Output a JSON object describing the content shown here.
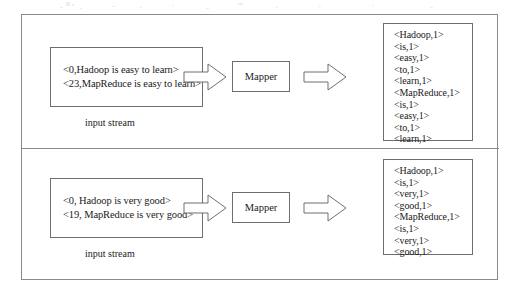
{
  "diagram": {
    "type": "flow",
    "frame_color": "#8a8a8a",
    "box_border_color": "#6e6e6e",
    "background": "#ffffff",
    "stages": [
      {
        "name": "stage-top",
        "input_stream": {
          "caption": "input stream",
          "lines": [
            "<0,Hadoop is easy to learn>",
            "<23,MapReduce is easy to learn>"
          ]
        },
        "processor": {
          "label": "Mapper"
        },
        "arrows": [
          {
            "name": "arrow-input-to-mapper",
            "direction": "right"
          },
          {
            "name": "arrow-mapper-to-output",
            "direction": "right"
          }
        ],
        "output": {
          "lines": [
            "<Hadoop,1>",
            "<is,1>",
            "<easy,1>",
            "<to,1>",
            "<learn,1>",
            "<MapReduce,1>",
            "<is,1>",
            "<easy,1>",
            "<to,1>",
            "<learn,1>"
          ]
        }
      },
      {
        "name": "stage-bottom",
        "input_stream": {
          "caption": "input stream",
          "lines": [
            "<0, Hadoop is very good>",
            "<19, MapReduce is very good>"
          ]
        },
        "processor": {
          "label": "Mapper"
        },
        "arrows": [
          {
            "name": "arrow-input-to-mapper",
            "direction": "right"
          },
          {
            "name": "arrow-mapper-to-output",
            "direction": "right"
          }
        ],
        "output": {
          "lines": [
            "<Hadoop,1>",
            "<is,1>",
            "<very,1>",
            "<good,1>",
            "<MapReduce,1>",
            "<is,1>",
            "<very,1>",
            "<good,1>"
          ]
        }
      }
    ]
  }
}
